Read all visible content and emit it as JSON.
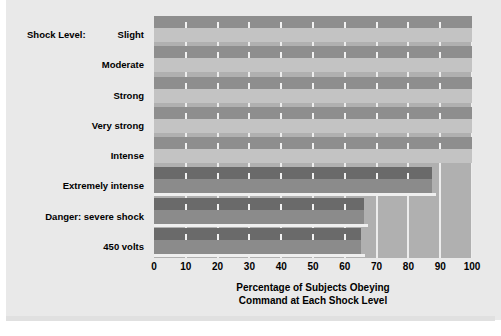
{
  "figure": {
    "clipped_heading": "",
    "axis_prefix": "Shock Level:"
  },
  "chart_data": {
    "type": "bar",
    "orientation": "horizontal",
    "title": "",
    "xlabel_line1": "Percentage of Subjects Obeying",
    "xlabel_line2": "Command at Each Shock Level",
    "ylabel": "Shock Level:",
    "categories": [
      "Slight",
      "Moderate",
      "Strong",
      "Very strong",
      "Intense",
      "Extremely intense",
      "Danger: severe shock",
      "450 volts"
    ],
    "values": [
      100,
      100,
      100,
      100,
      100,
      87.5,
      66,
      65
    ],
    "xlim": [
      0,
      100
    ],
    "xticks": [
      0,
      10,
      20,
      30,
      40,
      50,
      60,
      70,
      80,
      90,
      100
    ],
    "xtick_labels": [
      "0",
      "10",
      "20",
      "30",
      "40",
      "50",
      "60",
      "70",
      "80",
      "90",
      "100"
    ],
    "grid": true,
    "legend": "none",
    "colors": {
      "panel_background": "#e9e9e9",
      "plot_background": "#b0b0b0",
      "bar_face": "#c3c3c3",
      "bar_top": "#8e8e8e",
      "bar_face_short": "#8b8b8b",
      "bar_top_short": "#6a6a6a",
      "gridline": "#f2f2f2",
      "text": "#000000"
    }
  }
}
